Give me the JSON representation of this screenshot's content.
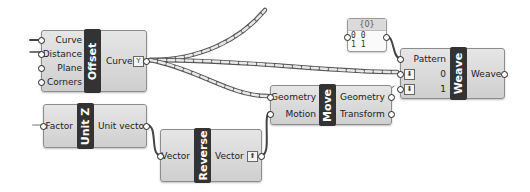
{
  "canvas": {
    "background": "#ffffff",
    "title_bar_color": "#333333",
    "node_fill": "#d8d8d8"
  },
  "nodes": {
    "offset": {
      "title": "Offset",
      "inputs": [
        "Curve",
        "Distance",
        "Plane",
        "Corners"
      ],
      "outputs": [
        "Curve"
      ],
      "output_icon": "graft-icon",
      "output_icon_glyph": "Y"
    },
    "weave": {
      "title": "Weave",
      "inputs": [
        "Pattern",
        "0",
        "1"
      ],
      "input_icons": [
        "flatten-icon",
        "flatten-icon"
      ],
      "input_icon_glyph": "⬇",
      "outputs": [
        "Weave"
      ]
    },
    "move": {
      "title": "Move",
      "inputs": [
        "Geometry",
        "Motion"
      ],
      "outputs": [
        "Geometry",
        "Transform"
      ]
    },
    "unit_z": {
      "title": "Unit Z",
      "inputs": [
        "Factor"
      ],
      "outputs": [
        "Unit vector"
      ]
    },
    "reverse": {
      "title": "Reverse",
      "inputs": [
        "Vector"
      ],
      "outputs": [
        "Vector"
      ],
      "output_icon": "simplify-icon",
      "output_icon_glyph": "⬆"
    }
  },
  "panel": {
    "header": "{0}",
    "rows": [
      "0 0",
      "1 1"
    ]
  }
}
